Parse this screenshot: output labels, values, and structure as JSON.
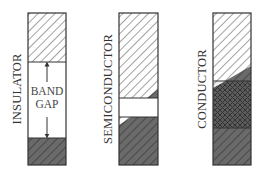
{
  "diagram": {
    "panels": [
      {
        "label": "INSULATOR",
        "bands": {
          "conduction": "empty (hatched)",
          "gap": "large",
          "valence": "filled (dark hatched)"
        },
        "gap_label": [
          "BAND",
          "GAP"
        ],
        "gap_arrows": [
          "up-arrow",
          "down-arrow"
        ]
      },
      {
        "label": "SEMICONDUCTOR",
        "bands": {
          "conduction": "mostly empty, small filled corner",
          "gap": "small",
          "valence": "mostly filled, small empty corner"
        }
      },
      {
        "label": "CONDUCTOR",
        "bands": {
          "conduction": "partially filled",
          "overlap": "overlapping bands (cross-hatched)",
          "valence": "filled (dark hatched)"
        }
      }
    ],
    "colors": {
      "outline": "#333333",
      "hatch_line": "#555555",
      "filled": "#6e6e6e",
      "background": "#ffffff"
    }
  }
}
